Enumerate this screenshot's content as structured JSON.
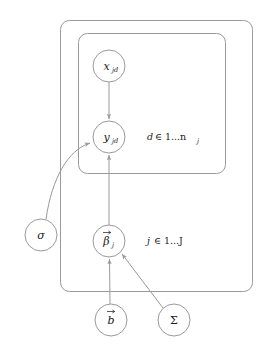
{
  "diagram": {
    "type": "plate-notation-graphical-model",
    "background_color": "#ffffff",
    "stroke_color": "#9a9a9a",
    "text_color": "#1a1a1a",
    "nodes": [
      {
        "id": "x",
        "symbol": "x",
        "subscript": "jd",
        "label": "x_jd",
        "cx": 109,
        "cy": 66,
        "r": 16,
        "observed": false
      },
      {
        "id": "y",
        "symbol": "y",
        "subscript": "jd",
        "label": "y_jd",
        "cx": 109,
        "cy": 137,
        "r": 16,
        "observed": false
      },
      {
        "id": "beta",
        "symbol": "β",
        "subscript": "j",
        "label": "beta_j",
        "vector": true,
        "cx": 109,
        "cy": 241,
        "r": 16,
        "observed": false
      },
      {
        "id": "sigma",
        "symbol": "σ",
        "subscript": "",
        "label": "sigma",
        "cx": 41,
        "cy": 235,
        "r": 16,
        "observed": false
      },
      {
        "id": "b",
        "symbol": "b",
        "subscript": "",
        "label": "b",
        "vector": true,
        "cx": 111,
        "cy": 320,
        "r": 16,
        "observed": false
      },
      {
        "id": "Sigma",
        "symbol": "Σ",
        "subscript": "",
        "label": "Sigma",
        "cx": 174,
        "cy": 320,
        "r": 16,
        "observed": false
      }
    ],
    "edges": [
      {
        "from": "x",
        "to": "y",
        "style": "straight"
      },
      {
        "from": "sigma",
        "to": "y",
        "style": "curved"
      },
      {
        "from": "beta",
        "to": "y",
        "style": "straight"
      },
      {
        "from": "b",
        "to": "beta",
        "style": "straight"
      },
      {
        "from": "Sigma",
        "to": "beta",
        "style": "straight"
      }
    ],
    "plates": [
      {
        "id": "outer-plate",
        "label_var": "j",
        "label_rel": "∈",
        "label_range": "1...J",
        "label_text": "j ∈ 1...J",
        "x": 60,
        "y": 20,
        "width": 192,
        "height": 271,
        "rx": 9,
        "label_x": 147,
        "label_y": 244
      },
      {
        "id": "inner-plate",
        "label_var": "d",
        "label_rel": "∈",
        "label_range": "1...n",
        "label_sub": "j",
        "label_text": "d ∈ 1...n_j",
        "x": 78,
        "y": 33,
        "width": 147,
        "height": 140,
        "rx": 9,
        "label_x": 147,
        "label_y": 140
      }
    ]
  }
}
